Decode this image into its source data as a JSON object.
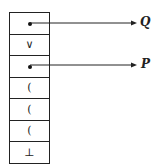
{
  "diagram": {
    "stack_cells": [
      {
        "content": "",
        "pointer": "Q"
      },
      {
        "content": "∨"
      },
      {
        "content": "",
        "pointer": "P"
      },
      {
        "content": "("
      },
      {
        "content": "("
      },
      {
        "content": "("
      },
      {
        "content": "⊥"
      }
    ],
    "pointer_labels": {
      "q": "Q",
      "p": "P"
    },
    "line_color": "#222222"
  }
}
